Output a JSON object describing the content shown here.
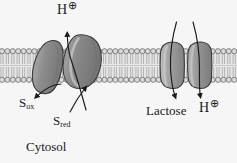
{
  "figure": {
    "background_color": "#f6f6f7",
    "caption_region": "Cytosol"
  },
  "labels": {
    "proton_out": "H",
    "proton_out_charge": "⊕",
    "s_oxidized_symbol": "S",
    "s_oxidized_sub": "ox",
    "s_reduced_symbol": "S",
    "s_reduced_sub": "red",
    "lactose": "Lactose",
    "proton_in": "H",
    "proton_in_charge": "⊕",
    "cytosol": "Cytosol"
  },
  "membrane": {
    "name": "phospholipid-bilayer",
    "top_y": 49,
    "bottom_y": 82,
    "head_color": "#d9d9da",
    "head_stroke": "#4a4a4a",
    "tail_color": "#c9c9ca",
    "core_color": "#e3e3e3",
    "head_radius": 2.6,
    "head_spacing": 5.4
  },
  "proteins": [
    {
      "name": "electron-transport-complex-left-lobe",
      "fill": "#8d8d8e",
      "stroke": "#3b3b3b",
      "highlight": "#b0b0b1"
    },
    {
      "name": "electron-transport-complex-right-lobe",
      "fill": "#8a8a8b",
      "stroke": "#3b3b3b",
      "highlight": "#adadae"
    },
    {
      "name": "lactose-permease-left-lobe",
      "fill": "#9a9a9b",
      "stroke": "#3b3b3b",
      "highlight": "#b8b8b9"
    },
    {
      "name": "lactose-permease-right-lobe",
      "fill": "#919192",
      "stroke": "#3b3b3b",
      "highlight": "#b2b2b3"
    }
  ],
  "arrows": [
    {
      "name": "proton-efflux-arrow",
      "direction": "up",
      "color": "#1b1b1b"
    },
    {
      "name": "s-oxidized-arrow",
      "direction": "down-left",
      "color": "#1b1b1b"
    },
    {
      "name": "s-reduced-arrow",
      "direction": "up-right",
      "color": "#1b1b1b"
    },
    {
      "name": "lactose-influx-arrow",
      "direction": "down",
      "color": "#1b1b1b"
    },
    {
      "name": "proton-influx-arrow",
      "direction": "down",
      "color": "#1b1b1b"
    }
  ]
}
